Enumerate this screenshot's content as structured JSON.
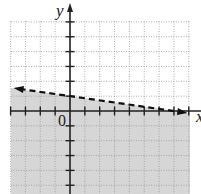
{
  "chart_data": {
    "type": "line",
    "title": "",
    "xlabel": "x",
    "ylabel": "y",
    "origin_label": "0",
    "xlim": [
      -4,
      8
    ],
    "ylim": [
      -5.5,
      6
    ],
    "grid": true,
    "grid_style": "dotted",
    "tick_spacing": 1,
    "series": [
      {
        "name": "boundary",
        "equation": "y = -x/7 + 1",
        "slope": -0.142857,
        "intercept": 1,
        "style": "dashed",
        "arrows": "both",
        "x": [
          -4,
          8
        ],
        "y": [
          1.571,
          -0.143
        ]
      }
    ],
    "shaded_region": "below boundary line (y < -x/7 + 1)",
    "colors": {
      "shade": "#d6d6d6",
      "grid": "#9a9a9a",
      "axis": "#222222",
      "line": "#111111"
    }
  }
}
